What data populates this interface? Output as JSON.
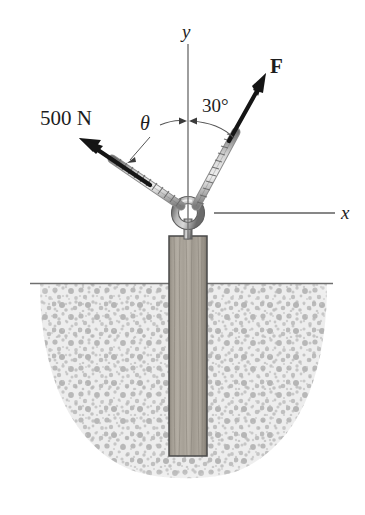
{
  "figure": {
    "type": "engineering-mechanics-free-body-diagram",
    "canvas": {
      "width": 365,
      "height": 515
    },
    "background_color": "#ffffff"
  },
  "axes": {
    "y_label": "y",
    "x_label": "x",
    "origin_px": {
      "x": 188,
      "y": 213
    },
    "y_axis_top_px": {
      "x": 188,
      "y": 44
    },
    "x_axis_right_px": {
      "x": 335,
      "y": 213
    },
    "line_color": "#6b6b6b"
  },
  "forces": [
    {
      "name": "left-rope-force",
      "label": "500 N",
      "magnitude": 500,
      "unit": "N",
      "angle_label": "θ",
      "angle_from_y_axis_deg": null,
      "direction": "up-and-to-the-left",
      "arrow_color": "#151515",
      "tip_px": {
        "x": 80,
        "y": 140
      },
      "tail_px": {
        "x": 181,
        "y": 208
      }
    },
    {
      "name": "right-rope-force",
      "label": "F",
      "angle_label": "30°",
      "angle_from_y_axis_deg": 30,
      "direction": "up-and-to-the-right",
      "arrow_color": "#151515",
      "tip_px": {
        "x": 266,
        "y": 74
      },
      "tail_px": {
        "x": 195,
        "y": 208
      }
    }
  ],
  "angles": [
    {
      "name": "theta-angle",
      "label": "θ",
      "measured_from": "y-axis",
      "side": "left"
    },
    {
      "name": "thirty-degree-angle",
      "label": "30°",
      "measured_from": "y-axis",
      "side": "right"
    }
  ],
  "objects": {
    "eye_bolt": {
      "name": "eye-bolt",
      "center_px": {
        "x": 188,
        "y": 213
      },
      "ring_outer_radius": 13,
      "ring_inner_radius": 6.5,
      "color": "#8d8d8d"
    },
    "post": {
      "name": "wooden-post",
      "material": "wood",
      "top_px": {
        "x": 188,
        "y": 236
      },
      "bottom_px": {
        "x": 188,
        "y": 456
      },
      "width_px": 38,
      "fill_color": "#9a948b",
      "edge_color": "#4a4a4a"
    },
    "ground": {
      "name": "ground-line",
      "surface_y_px": 283,
      "left_x_px": 30,
      "right_x_px": 333,
      "line_color": "#6f6f6f"
    },
    "soil": {
      "name": "soil-excavation",
      "description": "Stippled bowl-shaped soil region containing the post",
      "fill_color": "#e9e9e9",
      "stipple_color": "#a9a9a9",
      "bowl_left_top_px": {
        "x": 40,
        "y": 285
      },
      "bowl_right_top_px": {
        "x": 327,
        "y": 285
      },
      "bowl_bottom_y_px": 478
    },
    "ropes": [
      {
        "name": "left-rope",
        "from_px": {
          "x": 181,
          "y": 205
        },
        "to_px": {
          "x": 113,
          "y": 160
        },
        "color": "#7d7d7d"
      },
      {
        "name": "right-rope",
        "from_px": {
          "x": 196,
          "y": 205
        },
        "to_px": {
          "x": 235,
          "y": 133
        },
        "color": "#7d7d7d"
      }
    ]
  },
  "colors": {
    "ink": "#151515",
    "axis": "#6b6b6b",
    "soil_fill": "#e9e9e9",
    "soil_speck": "#a9a9a9",
    "wood": "#9a948b",
    "metal": "#8d8d8d"
  }
}
